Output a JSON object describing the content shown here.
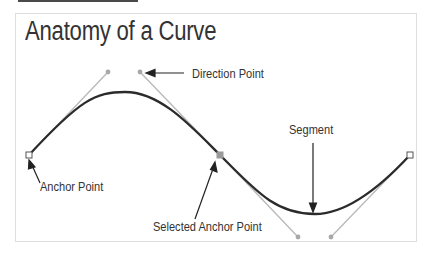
{
  "title": "Anatomy of a Curve",
  "labels": {
    "direction_point": "Direction Point",
    "anchor_point": "Anchor Point",
    "segment": "Segment",
    "selected_anchor_point": "Selected Anchor Point"
  },
  "colors": {
    "curve": "#2b2b2b",
    "handle": "#b5b5b5",
    "selected_anchor": "#9a9a9a",
    "frame_border": "#dedede",
    "text": "#333333"
  }
}
